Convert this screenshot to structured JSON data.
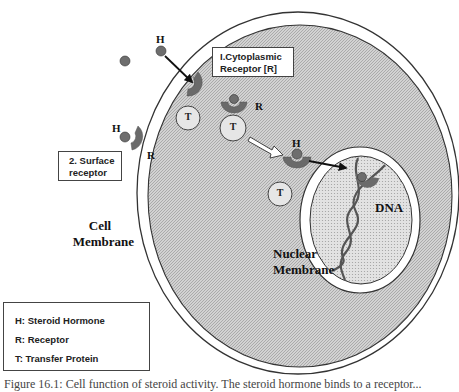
{
  "figure": {
    "colors": {
      "background": "#ffffff",
      "cytoplasm_fill": "#cfcfcf",
      "nucleoplasm_fill": "#dcdcdc",
      "membrane_stroke": "#333333",
      "hormone": "#6e6e6e",
      "receptor": "#6a6a6a",
      "transfer_protein": "#e6e6e6",
      "arrow": "#111111"
    },
    "callouts": {
      "cytoplasmic_receptor": {
        "line1": "I.Cytoplasmic",
        "line2": "Receptor [R]"
      },
      "surface_receptor": {
        "line1": "2. Surface",
        "line2": "receptor"
      }
    },
    "labels": {
      "cell_membrane": {
        "line1": "Cell",
        "line2": "Membrane"
      },
      "nuclear_membrane": {
        "line1": "Nuclear",
        "line2": "Membrane"
      },
      "dna": "DNA",
      "h_top": "H",
      "h_surface": "H",
      "r_surface": "R",
      "r_cytoplasm": "R",
      "h_nuclear": "H",
      "t1": "T",
      "t2": "T",
      "t3": "T"
    },
    "legend": {
      "items": [
        {
          "key": "H",
          "text": "H: Steroid Hormone"
        },
        {
          "key": "R",
          "text": "R: Receptor"
        },
        {
          "key": "T",
          "text": "T: Transfer Protein"
        }
      ]
    },
    "caption": "Figure 16.1: Cell function of steroid activity. The steroid hormone binds to a receptor..."
  }
}
